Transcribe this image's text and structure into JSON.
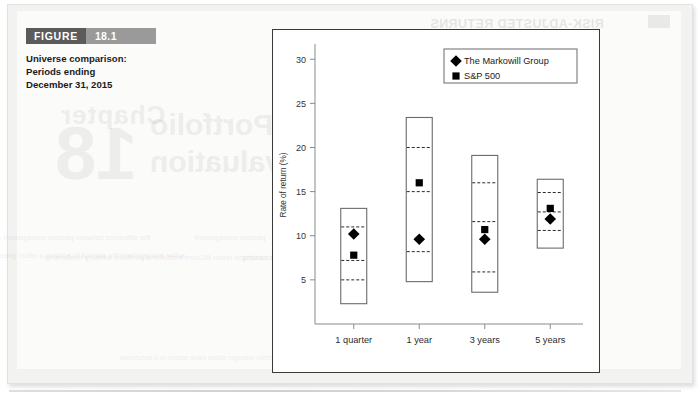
{
  "page": {
    "figure_label": "FIGURE",
    "figure_number": "18.1",
    "caption": "Universe comparison: Periods ending December 31, 2015",
    "bleed_through": {
      "header": "RISK-ADJUSTED RETURNS",
      "header_chip": "18.2",
      "sub1": "Evaluation Criteria",
      "sub2": "Investment Objective",
      "big_chapter": "Chapter",
      "big_number": "18",
      "big_title_1": "Portfolio",
      "big_title_2": "Evaluation",
      "body_col1": "the difference between passive management and active management is whether the manager attempts to achieve a return",
      "body_col2": "active management the attempt to achieve a return greater than a benchmark with use of forecasting skills",
      "body_col3": "passive management",
      "body_col4": "rate of return on the investment return successful return MCount institutional portfolios advisory relationship",
      "body_col5": "measure of return relative to risk analysis universe comparison quartile ranking",
      "footer": "Portfolio evaluation is the process of determining whether the portfolio manager added value relative to a benchmark"
    }
  },
  "chart_data": {
    "type": "box",
    "title": "",
    "xlabel": "",
    "ylabel": "Rate of return (%)",
    "ylim": [
      0,
      31.5
    ],
    "yticks": [
      5,
      10,
      15,
      20,
      25,
      30
    ],
    "ytick_labels": [
      "5",
      "10",
      "15",
      "20",
      "25",
      "30"
    ],
    "grid": false,
    "legend_position": "top-right",
    "legend": [
      {
        "label": "The Markowill Group",
        "marker": "diamond"
      },
      {
        "label": "S&P 500",
        "marker": "square"
      }
    ],
    "categories": [
      "1 quarter",
      "1 year",
      "3 years",
      "5 years"
    ],
    "boxes": [
      {
        "category": "1 quarter",
        "max": 13.1,
        "q3": 11.0,
        "median": 7.2,
        "q1": 5.0,
        "min": 2.3,
        "markowill": 10.2,
        "sp500": 7.8
      },
      {
        "category": "1 year",
        "max": 23.4,
        "q3": 20.0,
        "median": 15.0,
        "q1": 8.2,
        "min": 4.8,
        "markowill": 9.6,
        "sp500": 16.0
      },
      {
        "category": "3 years",
        "max": 19.1,
        "q3": 16.0,
        "median": 11.6,
        "q1": 5.9,
        "min": 3.6,
        "markowill": 9.6,
        "sp500": 10.7
      },
      {
        "category": "5 years",
        "max": 16.4,
        "q3": 14.9,
        "median": 12.7,
        "q1": 10.6,
        "min": 8.6,
        "markowill": 11.9,
        "sp500": 13.1
      }
    ]
  },
  "colors": {
    "figure_label_bg": "#5b5b5b",
    "figure_number_bg": "#9a9a9a",
    "chart_border": "#3a3a3a",
    "box_stroke": "#6b6b6b",
    "marker_fill": "#000000",
    "page_bg": "#f2f2f1"
  }
}
